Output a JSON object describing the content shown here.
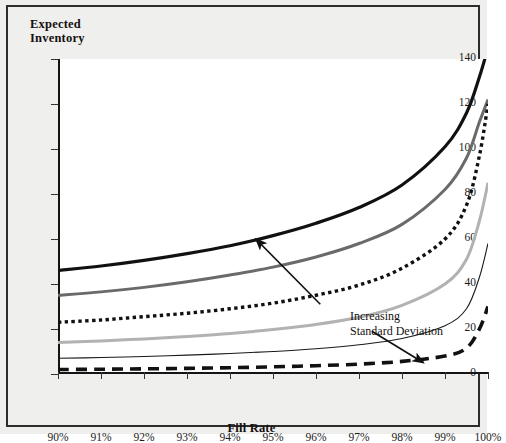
{
  "figure": {
    "background": "#eeeeec",
    "plot_background": "#ffffff",
    "border_color": "#2c2c2c"
  },
  "titles": {
    "y_line1": "Expected",
    "y_line2": "Inventory",
    "x_title": "Fill Rate"
  },
  "annotation": {
    "line1": "Increasing",
    "line2": "Standard Deviation"
  },
  "chart_data": {
    "type": "line",
    "title": "",
    "xlabel": "Fill Rate",
    "ylabel": "Expected Inventory",
    "xlim": [
      90,
      100
    ],
    "ylim": [
      0,
      140
    ],
    "ytick_labels": [
      "0",
      "20",
      "40",
      "60",
      "80",
      "100",
      "120",
      "140"
    ],
    "ytick_values": [
      0,
      20,
      40,
      60,
      80,
      100,
      120,
      140
    ],
    "xtick_labels": [
      "90%",
      "91%",
      "92%",
      "93%",
      "94%",
      "95%",
      "96%",
      "97%",
      "98%",
      "99%",
      "100%"
    ],
    "xtick_values": [
      90,
      91,
      92,
      93,
      94,
      95,
      96,
      97,
      98,
      99,
      100
    ],
    "grid": false,
    "legend": "none",
    "x": [
      90,
      91,
      92,
      93,
      94,
      95,
      96,
      97,
      98,
      99,
      99.5,
      99.8,
      100
    ],
    "series": [
      {
        "name": "sigma-6-highest",
        "style": "solid",
        "color": "#111111",
        "width": 3.2,
        "values": [
          46,
          48,
          50.5,
          53.5,
          57,
          61.5,
          67,
          74,
          84,
          101,
          116,
          132,
          145
        ]
      },
      {
        "name": "sigma-5",
        "style": "solid",
        "color": "#6a6a6a",
        "width": 3.0,
        "values": [
          35,
          36.5,
          38.5,
          41,
          44,
          47.5,
          52,
          58,
          66.5,
          82,
          96,
          112,
          122
        ]
      },
      {
        "name": "sigma-4",
        "style": "dotted",
        "color": "#111111",
        "width": 3.4,
        "values": [
          23,
          24,
          25.5,
          27,
          29,
          31.5,
          35,
          39.5,
          47,
          60,
          75,
          97,
          120
        ]
      },
      {
        "name": "sigma-3",
        "style": "solid",
        "color": "#b2b2b2",
        "width": 3.0,
        "values": [
          14,
          14.7,
          15.6,
          16.7,
          18,
          19.8,
          22,
          25.2,
          30.5,
          40,
          51,
          68,
          85
        ]
      },
      {
        "name": "sigma-2",
        "style": "solid",
        "color": "#1a1a1a",
        "width": 1.1,
        "values": [
          7,
          7.3,
          7.8,
          8.4,
          9.1,
          10,
          11.2,
          13,
          15.8,
          21.5,
          29,
          43,
          58
        ]
      },
      {
        "name": "sigma-1-lowest",
        "style": "dashed",
        "color": "#111111",
        "width": 3.6,
        "values": [
          2,
          2.1,
          2.3,
          2.5,
          2.8,
          3.2,
          3.7,
          4.4,
          5.6,
          8,
          11.5,
          20,
          30
        ]
      }
    ],
    "annotations": [
      {
        "text": "Increasing Standard Deviation",
        "arrows": [
          {
            "from": [
              96.1,
              31
            ],
            "to": [
              94.6,
              60
            ],
            "direction": "up-left"
          },
          {
            "from": [
              97.3,
              19
            ],
            "to": [
              98.5,
              5
            ],
            "direction": "down-right"
          }
        ]
      }
    ]
  }
}
